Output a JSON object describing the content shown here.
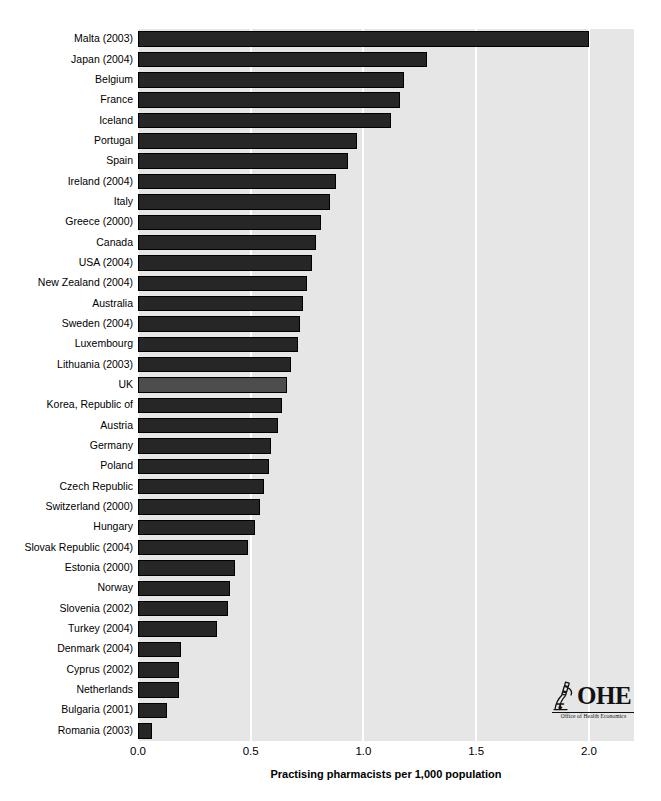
{
  "chart_data": {
    "type": "bar",
    "orientation": "horizontal",
    "title": "",
    "xlabel": "Practising pharmacists per 1,000 population",
    "ylabel": "",
    "xlim": [
      0.0,
      2.2
    ],
    "xticks": [
      "0.0",
      "0.5",
      "1.0",
      "1.5",
      "2.0"
    ],
    "xtick_values": [
      0.0,
      0.5,
      1.0,
      1.5,
      2.0
    ],
    "grid": "vertical-white-gridlines",
    "legend": "none",
    "highlight_category": "UK",
    "colors": {
      "bar": "#262626",
      "bar_highlight": "#4d4d4d",
      "plot_background": "#e6e6e6",
      "gridline": "#ffffff",
      "figure_background": "#ffffff",
      "text": "#000000"
    },
    "categories": [
      "Malta (2003)",
      "Japan (2004)",
      "Belgium",
      "France",
      "Iceland",
      "Portugal",
      "Spain",
      "Ireland (2004)",
      "Italy",
      "Greece (2000)",
      "Canada",
      "USA (2004)",
      "New Zealand (2004)",
      "Australia",
      "Sweden (2004)",
      "Luxembourg",
      "Lithuania (2003)",
      "UK",
      "Korea, Republic of",
      "Austria",
      "Germany",
      "Poland",
      "Czech Republic",
      "Switzerland (2000)",
      "Hungary",
      "Slovak Republic (2004)",
      "Estonia (2000)",
      "Norway",
      "Slovenia (2002)",
      "Turkey (2004)",
      "Denmark (2004)",
      "Cyprus (2002)",
      "Netherlands",
      "Bulgaria (2001)",
      "Romania (2003)"
    ],
    "values": [
      2.0,
      1.28,
      1.18,
      1.16,
      1.12,
      0.97,
      0.93,
      0.88,
      0.85,
      0.81,
      0.79,
      0.77,
      0.75,
      0.73,
      0.72,
      0.71,
      0.68,
      0.66,
      0.64,
      0.62,
      0.59,
      0.58,
      0.56,
      0.54,
      0.52,
      0.49,
      0.43,
      0.41,
      0.4,
      0.35,
      0.19,
      0.18,
      0.18,
      0.13,
      0.06
    ]
  },
  "logo": {
    "wordmark": "OHE",
    "tagline": "Office of Health Economics",
    "mark": "microscope-icon"
  }
}
